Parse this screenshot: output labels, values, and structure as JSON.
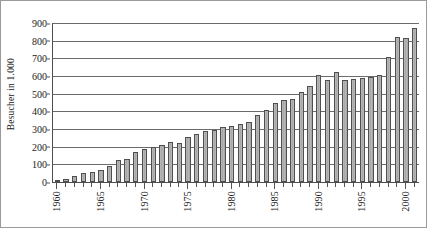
{
  "chart_data": {
    "type": "bar",
    "title": "",
    "subtitle": "",
    "xlabel": "",
    "ylabel": "Besucher in 1.000",
    "ylim": [
      0,
      900
    ],
    "ytick_labels": [
      "0",
      "100",
      "200",
      "300",
      "400",
      "500",
      "600",
      "700",
      "800",
      "900"
    ],
    "ytick_values": [
      0,
      100,
      200,
      300,
      400,
      500,
      600,
      700,
      800,
      900
    ],
    "grid": true,
    "legend": null,
    "bar_color": "#b0b0b0",
    "bar_edge_color": "#4f4f4f",
    "axis_color": "#4d4d4d",
    "background_color": "#ffffff",
    "xtick_labels": [
      "1960",
      "1965",
      "1970",
      "1975",
      "1980",
      "1985",
      "1990",
      "1995",
      "2000"
    ],
    "xtick_label_rotation": 90,
    "categories": [
      "1960",
      "1961",
      "1962",
      "1963",
      "1964",
      "1965",
      "1966",
      "1967",
      "1968",
      "1969",
      "1970",
      "1971",
      "1972",
      "1973",
      "1974",
      "1975",
      "1976",
      "1977",
      "1978",
      "1979",
      "1980",
      "1981",
      "1982",
      "1983",
      "1984",
      "1985",
      "1986",
      "1987",
      "1988",
      "1989",
      "1990",
      "1991",
      "1992",
      "1993",
      "1994",
      "1995",
      "1996",
      "1997",
      "1998",
      "1999",
      "2000",
      "2001"
    ],
    "values": [
      5,
      18,
      33,
      50,
      55,
      70,
      88,
      125,
      133,
      172,
      185,
      197,
      207,
      225,
      223,
      252,
      272,
      288,
      297,
      313,
      318,
      330,
      337,
      380,
      405,
      448,
      467,
      470,
      512,
      545,
      608,
      578,
      620,
      580,
      583,
      590,
      597,
      607,
      706,
      820,
      815,
      870
    ]
  }
}
